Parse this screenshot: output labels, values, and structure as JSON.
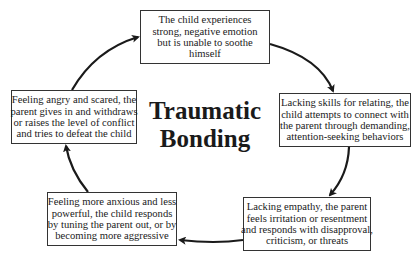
{
  "diagram": {
    "title_lines": [
      "Traumatic",
      "Bonding"
    ],
    "cycle_direction": "clockwise",
    "colors": {
      "text": "#1a1a1a",
      "border": "#333333",
      "arrow": "#1a1a1a",
      "background": "#ffffff"
    },
    "nodes": [
      {
        "id": "top",
        "lines": [
          "The child experiences",
          "strong, negative emotion",
          "but is unable to soothe",
          "himself"
        ]
      },
      {
        "id": "right",
        "lines": [
          "Lacking skills for relating, the",
          "child attempts to connect with",
          "the parent through demanding,",
          "attention-seeking behaviors"
        ]
      },
      {
        "id": "bottom-right",
        "lines": [
          "Lacking empathy, the parent",
          "feels irritation or resentment",
          "and responds with disapproval,",
          "criticism, or threats"
        ]
      },
      {
        "id": "bottom-left",
        "lines": [
          "Feeling more anxious and less",
          "powerful, the child responds",
          "by tuning the parent out, or by",
          "becoming more aggressive"
        ]
      },
      {
        "id": "left",
        "lines": [
          "Feeling angry and scared, the",
          "parent gives in and withdraws",
          "or raises the level of conflict",
          "and tries to defeat the child"
        ]
      }
    ],
    "edges": [
      {
        "from": "top",
        "to": "right"
      },
      {
        "from": "right",
        "to": "bottom-right"
      },
      {
        "from": "bottom-right",
        "to": "bottom-left"
      },
      {
        "from": "bottom-left",
        "to": "left"
      },
      {
        "from": "left",
        "to": "top"
      }
    ]
  }
}
